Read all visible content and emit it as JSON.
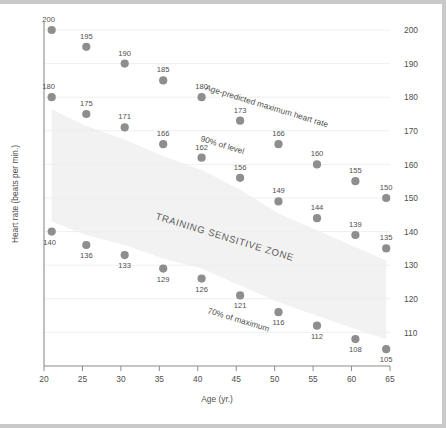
{
  "chart_data": {
    "type": "scatter",
    "title": "",
    "xlabel": "Age (yr.)",
    "ylabel": "Heart rate (beats per min.)",
    "xlim": [
      20,
      65
    ],
    "ylim": [
      95,
      203
    ],
    "xticks": [
      20,
      25,
      30,
      35,
      40,
      45,
      50,
      55,
      60,
      65
    ],
    "xtick_labels": [
      "20",
      "25",
      "30",
      "35",
      "40",
      "45",
      "50",
      "55",
      "60",
      "65"
    ],
    "yticks_right": [
      100,
      110,
      120,
      130,
      140,
      150,
      160,
      170,
      180,
      190,
      200
    ],
    "ytick_labels_right": [
      "100",
      "110",
      "120",
      "130",
      "140",
      "150",
      "160",
      "170",
      "180",
      "190",
      "200"
    ],
    "grid": true,
    "legend_position": "inline-annotations",
    "x": [
      21,
      25.5,
      30.5,
      35.5,
      40.5,
      45.5,
      50.5,
      55.5,
      60.5,
      64.5
    ],
    "series": [
      {
        "name": "Age-predicted maximum heart rate",
        "values": [
          200,
          195,
          190,
          185,
          180,
          173,
          166,
          160,
          155,
          150
        ],
        "labels": [
          "200",
          "195",
          "190",
          "185",
          "180",
          "173",
          "166",
          "160",
          "155",
          "150"
        ]
      },
      {
        "name": "90% of level",
        "values": [
          180,
          175,
          171,
          166,
          162,
          156,
          149,
          144,
          139,
          135
        ],
        "labels": [
          "180",
          "175",
          "171",
          "166",
          "162",
          "156",
          "149",
          "144",
          "139",
          "135"
        ]
      },
      {
        "name": "70% of maximum",
        "values": [
          140,
          136,
          133,
          129,
          126,
          121,
          116,
          112,
          108,
          105
        ],
        "labels": [
          "140",
          "136",
          "133",
          "129",
          "126",
          "121",
          "116",
          "112",
          "108",
          "105"
        ]
      }
    ],
    "annotations": [
      {
        "text": "Age-predicted maximum heart rate",
        "rotation": 17
      },
      {
        "text": "90% of level",
        "rotation": 17
      },
      {
        "text": "TRAINING SENSITIVE ZONE",
        "rotation": 17
      },
      {
        "text": "70% of maximum",
        "rotation": 17
      }
    ],
    "colors": {
      "marker": "#8e8e8e",
      "axis": "#8c8c8c",
      "grid": "#ededed",
      "band": "#f2f2f2",
      "text": "#4f4f4f"
    }
  }
}
